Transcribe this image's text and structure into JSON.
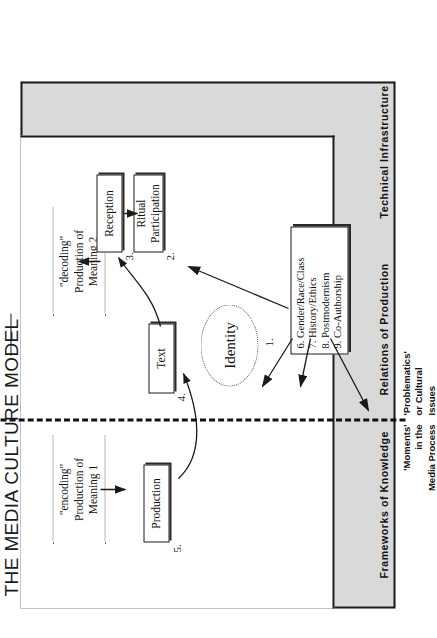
{
  "title": "THE MEDIA CULTURE MODEL",
  "callouts": [
    {
      "id": "encoding",
      "line1": "\"encoding\"",
      "line2": "Production of",
      "line3": "Meaning 1"
    },
    {
      "id": "decoding",
      "line1": "\"decoding\"",
      "line2": "Production of",
      "line3": "Meaning 2"
    }
  ],
  "moments": [
    {
      "number": "5.",
      "label": "Production"
    },
    {
      "number": "4.",
      "label": "Text"
    },
    {
      "number": "3.",
      "label": "Reception"
    },
    {
      "number": "2.",
      "label": "Ritual\nParticipation"
    },
    {
      "number": "1.",
      "label": "Identity"
    }
  ],
  "boxes": {
    "production": "Production",
    "text": "Text",
    "reception": "Reception",
    "ritual_line1": "Ritual",
    "ritual_line2": "Participation",
    "identity": "Identity"
  },
  "numbers": {
    "n1": "1.",
    "n2": "2.",
    "n3": "3.",
    "n4": "4.",
    "n5": "5."
  },
  "problematics_list": [
    "6. Gender/Race/Class",
    "7. History/Ethics",
    "8. Postmodernism",
    "9. Co-Authorship"
  ],
  "frame_labels": [
    "Frameworks of Knowledge",
    "Relations of Production",
    "Technical Infrastructure"
  ],
  "legend": {
    "left_line1": "'Moments'",
    "left_line2": "in the",
    "left_line3": "Media Process",
    "right_line1": "'Problematics'",
    "right_line2": "or Cultural",
    "right_line3": "Issues"
  },
  "colors": {
    "frame_grey": "#d9d9d9",
    "ink": "#1a1a1a",
    "paper": "#ffffff"
  }
}
